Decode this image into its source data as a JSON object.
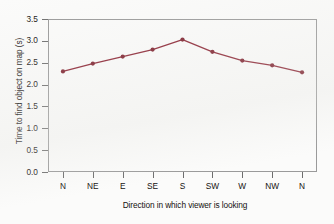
{
  "chart_data": {
    "type": "line",
    "title": "",
    "xlabel": "Direction in which viewer is looking",
    "ylabel": "Time to find object on map (s)",
    "categories": [
      "N",
      "NE",
      "E",
      "SE",
      "S",
      "SW",
      "W",
      "NW",
      "N"
    ],
    "values": [
      2.3,
      2.48,
      2.64,
      2.8,
      3.03,
      2.75,
      2.55,
      2.44,
      2.28
    ],
    "series": [
      {
        "name": "Time to find object on map",
        "values": [
          2.3,
          2.48,
          2.64,
          2.8,
          3.03,
          2.75,
          2.55,
          2.44,
          2.28
        ]
      }
    ],
    "ylim": [
      0.0,
      3.5
    ],
    "ytick_labels": [
      "0.0",
      "0.5",
      "1.0",
      "1.5",
      "2.0",
      "2.5",
      "3.0",
      "3.5"
    ],
    "ytick_values": [
      0.0,
      0.5,
      1.0,
      1.5,
      2.0,
      2.5,
      3.0,
      3.5
    ],
    "xtick_labels": [
      "N",
      "NE",
      "E",
      "SE",
      "S",
      "SW",
      "W",
      "NW",
      "N"
    ],
    "grid": false,
    "legend": "none",
    "line_color": "#8B2332",
    "marker_color": "#7d1f2c",
    "marker": "circle",
    "axis_color": "#9a9a9a"
  }
}
